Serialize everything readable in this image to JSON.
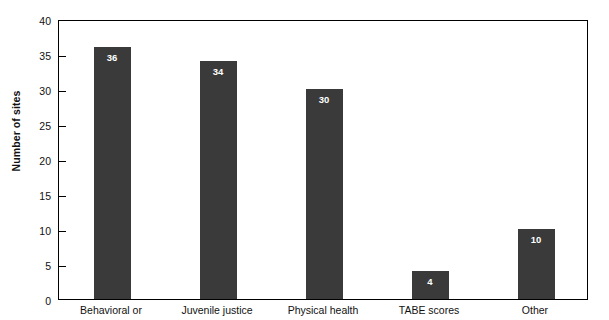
{
  "chart_data": {
    "type": "bar",
    "title": "",
    "subtitle": "",
    "xlabel": "",
    "ylabel": "Number of sites",
    "categories": [
      "Behavioral or",
      "Juvenile justice",
      "Physical health",
      "TABE scores",
      "Other"
    ],
    "values": [
      36,
      34,
      30,
      4,
      10
    ],
    "value_labels": [
      "36",
      "34",
      "30",
      "4",
      "10"
    ],
    "ylim": [
      0,
      40
    ],
    "ytick_step": 5,
    "yticks": [
      0,
      5,
      10,
      15,
      20,
      25,
      30,
      35,
      40
    ],
    "ytick_labels": [
      "0",
      "5",
      "10",
      "15",
      "20",
      "25",
      "30",
      "35",
      "40"
    ],
    "grid": false,
    "legend": null,
    "legend_position": "none",
    "bar_color": "#3a3a3a",
    "axis_color": "#000000",
    "value_label_color": "#ffffff",
    "background_color": "#ffffff",
    "value_label_position": "inside-top",
    "tick_direction": "inward",
    "frame": "full-box"
  }
}
